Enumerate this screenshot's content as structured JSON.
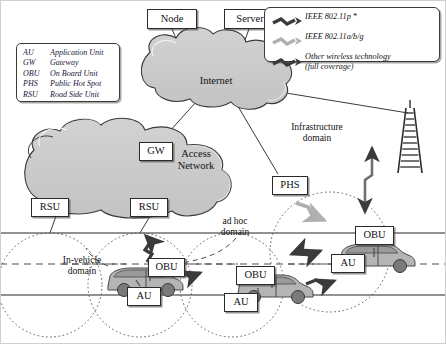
{
  "diagram": {
    "colors": {
      "cloud_fill": "#c9c9c9",
      "cloud_stroke": "#3a3a3a",
      "car_body": "#b4b4b4",
      "car_dark": "#8f8f8f",
      "wheel": "#7a7a7a",
      "arrow_dark": "#3b3b3b",
      "arrow_light": "#b0b0b0",
      "road": "#6e6e6e",
      "dotted": "#5a5a5a",
      "box_border": "#2b2b2b"
    }
  },
  "abbreviations": {
    "rows": [
      {
        "abbr": "AU",
        "meaning": "Application Unit"
      },
      {
        "abbr": "GW",
        "meaning": "Gateway"
      },
      {
        "abbr": "OBU",
        "meaning": "On Board Unit"
      },
      {
        "abbr": "PHS",
        "meaning": "Public Hot Spot"
      },
      {
        "abbr": "RSU",
        "meaning": "Road Side Unit"
      }
    ]
  },
  "wireless_legend": {
    "rows": [
      {
        "icon": "zigzag-arrow-dark",
        "label": "IEEE 802.11p *",
        "sub": ""
      },
      {
        "icon": "zigzag-arrow-light",
        "label": "IEEE 802.11a/b/g",
        "sub": ""
      },
      {
        "icon": "zigzag-arrow-dark",
        "label": "Other wireless technology",
        "sub": "(full coverage)"
      }
    ]
  },
  "nodes": {
    "node": "Node",
    "server": "Server",
    "gateway": "GW",
    "rsu_left": "RSU",
    "rsu_right": "RSU",
    "phs": "PHS",
    "obu_left": "OBU",
    "obu_middle": "OBU",
    "obu_right": "OBU",
    "au_left": "AU",
    "au_middle": "AU",
    "au_right": "AU"
  },
  "clouds": {
    "internet": "Internet",
    "access_network_line1": "Access",
    "access_network_line2": "Network"
  },
  "domains": {
    "infrastructure_line1": "Infrastructure",
    "infrastructure_line2": "domain",
    "adhoc_line1": "ad hoc",
    "adhoc_line2": "domain",
    "invehicle_line1": "In-vehicle",
    "invehicle_line2": "domain"
  }
}
